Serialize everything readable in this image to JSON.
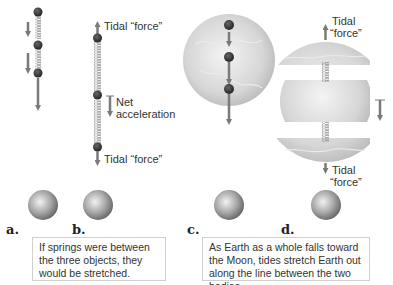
{
  "panels": [
    {
      "id": "a",
      "label": "a."
    },
    {
      "id": "b",
      "label": "b.",
      "annotations": {
        "top": "Tidal “force”",
        "middle_line1": "Net",
        "middle_line2": "acceleration",
        "bottom": "Tidal “force”"
      }
    },
    {
      "id": "c",
      "label": "c."
    },
    {
      "id": "d",
      "label": "d.",
      "annotations": {
        "top_line1": "Tidal",
        "top_line2": "“force”",
        "bottom_line1": "Tidal",
        "bottom_line2": "“force”"
      }
    }
  ],
  "captions": {
    "left": "If springs were between the three objects, they would be stretched.",
    "right": "As Earth as a whole falls toward the Moon, tides stretch Earth out along the line between the two bodies."
  },
  "colors": {
    "arrow": "#7a7a7a",
    "ball": "#3a3a3a",
    "spring": "#9a9a9a",
    "earth": "#d9d9d9",
    "moon": "#b5b5b5"
  }
}
